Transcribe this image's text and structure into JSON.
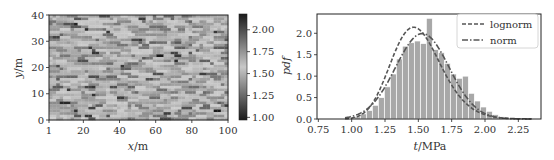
{
  "chart_data": [
    {
      "type": "heatmap",
      "title": "",
      "xlabel": "x/m",
      "ylabel": "y/m",
      "x_ticks": [
        "1",
        "20",
        "40",
        "60",
        "80",
        "100"
      ],
      "y_ticks": [
        "0",
        "10",
        "20",
        "30",
        "40"
      ],
      "xlim": [
        1,
        100
      ],
      "ylim": [
        0,
        40
      ],
      "grid": {
        "cols": 50,
        "rows": 40,
        "seed": 7
      },
      "colorbar": {
        "ticks": [
          "1.00",
          "1.25",
          "1.50",
          "1.75",
          "2.00"
        ],
        "range": [
          0.97,
          2.18
        ],
        "colormap": "gray-diverging (dark at both ends, light at center)"
      },
      "value_mean": 1.52,
      "value_std": 0.19
    },
    {
      "type": "bar",
      "subtype": "histogram-with-fits",
      "title": "",
      "xlabel": "t/MPa",
      "ylabel": "pdf",
      "x_ticks": [
        "0.75",
        "1.00",
        "1.25",
        "1.50",
        "1.75",
        "2.00",
        "2.25"
      ],
      "y_ticks": [
        "0.0",
        "0.5",
        "1.0",
        "1.5",
        "2.0"
      ],
      "xlim": [
        0.74,
        2.42
      ],
      "ylim": [
        0,
        2.45
      ],
      "bin_edges_start": 1.02,
      "bin_width": 0.045,
      "values": [
        0.05,
        0.12,
        0.2,
        0.32,
        0.5,
        0.75,
        1.05,
        1.4,
        1.7,
        1.78,
        1.82,
        1.76,
        2.35,
        1.62,
        1.55,
        1.3,
        1.05,
        0.95,
        1.0,
        0.6,
        0.42,
        0.28,
        0.18,
        0.1,
        0.05
      ],
      "series": [
        {
          "name": "lognorm",
          "style": "dashed",
          "mean": 1.5,
          "std": 0.19
        },
        {
          "name": "norm",
          "style": "dashdot",
          "mean": 1.53,
          "std": 0.2
        }
      ],
      "legend": {
        "position": "upper right",
        "entries": [
          "lognorm",
          "norm"
        ]
      },
      "grid": false
    }
  ],
  "left": {
    "xlabel_var": "x",
    "xlabel_unit": "/m",
    "ylabel_var": "y",
    "ylabel_unit": "/m"
  },
  "right": {
    "xlabel_var": "t",
    "xlabel_unit": "/MPa",
    "ylabel": "pdf",
    "legend": [
      "lognorm",
      "norm"
    ]
  },
  "colors": {
    "bar": "#a8a8a8",
    "bar_edge": "#ffffff",
    "curve": "#555555",
    "axis": "#222222"
  }
}
